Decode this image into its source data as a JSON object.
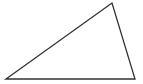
{
  "diagram": {
    "type": "triangle",
    "stroke_color": "#333333",
    "fill_color": "#ffffff",
    "stroke_width": 1.3,
    "vertices": [
      {
        "name": "bottom-left",
        "x": 6,
        "y": 79
      },
      {
        "name": "top",
        "x": 112,
        "y": 3
      },
      {
        "name": "bottom-right",
        "x": 135,
        "y": 79
      }
    ]
  }
}
